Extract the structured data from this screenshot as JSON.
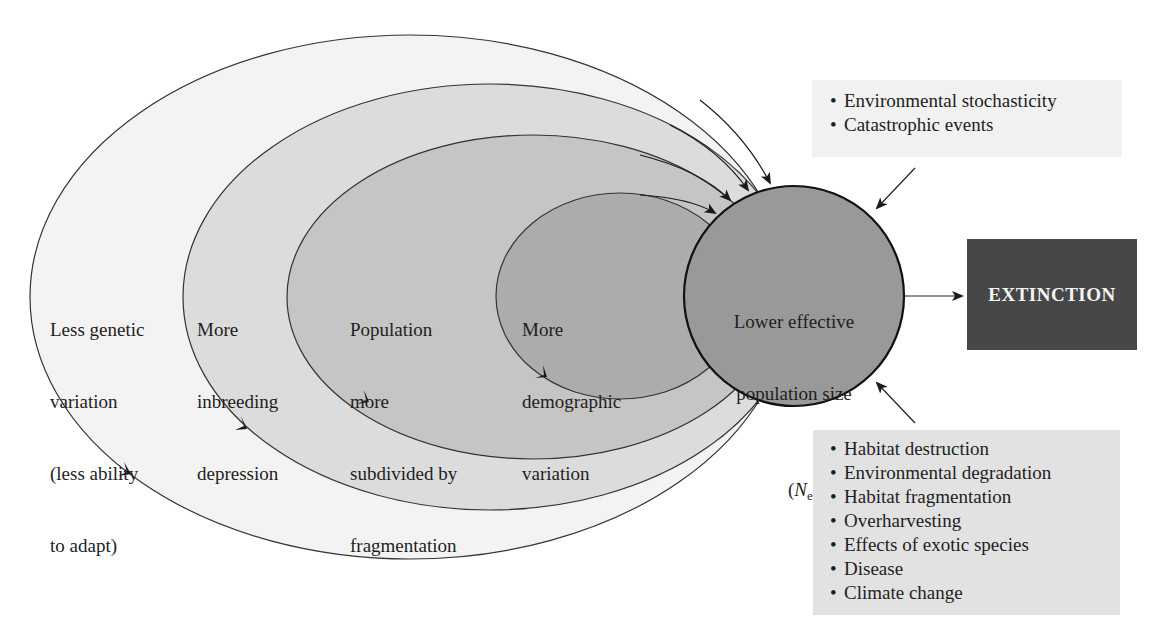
{
  "colors": {
    "ring1_fill": "#f3f3f3",
    "ring2_fill": "#dcdcdc",
    "ring3_fill": "#c5c5c5",
    "ring4_fill": "#acacac",
    "core_fill": "#999999",
    "extinction_fill": "#474747",
    "top_box_fill": "#f1f1f1",
    "bottom_box_fill": "#e2e2e2"
  },
  "rings": [
    {
      "id": "genetic-variation",
      "lines": [
        "Less genetic",
        "variation",
        "(less ability",
        "to adapt)"
      ]
    },
    {
      "id": "inbreeding",
      "lines": [
        "More",
        "inbreeding",
        "depression"
      ]
    },
    {
      "id": "fragmentation",
      "lines": [
        "Population",
        "more",
        "subdivided by",
        "fragmentation"
      ]
    },
    {
      "id": "demographic",
      "lines": [
        "More",
        "demographic",
        "variation"
      ]
    }
  ],
  "core": {
    "lines": [
      "Lower effective",
      "population size"
    ],
    "symbol_open": "(",
    "symbol": "N",
    "symbol_sub": "e",
    "symbol_close": ")"
  },
  "outcome": {
    "label": "EXTINCTION"
  },
  "stochastic_box": {
    "bullet": "•",
    "items": [
      "Environmental stochasticity",
      "Catastrophic events"
    ]
  },
  "drivers_box": {
    "bullet": "•",
    "items": [
      "Habitat destruction",
      "Environmental degradation",
      "Habitat fragmentation",
      "Overharvesting",
      "Effects of exotic species",
      "Disease",
      "Climate change"
    ]
  }
}
